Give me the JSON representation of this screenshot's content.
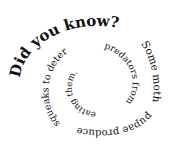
{
  "image": {
    "width": 174,
    "height": 150,
    "background": "#ffffff",
    "text_color": "#111111",
    "layout": "spiral text, clockwise, shrinking toward center"
  },
  "spiral": {
    "full_text": "Did you know? Some moth pupae produce squeaks to deter predators from eating them.",
    "segments": [
      {
        "text": "Did you know?",
        "size": 15
      },
      {
        "text": "Some moth",
        "size": 11
      },
      {
        "text": "pupae produce",
        "size": 10
      },
      {
        "text": "squeaks to deter",
        "size": 9.5
      },
      {
        "text": "predators from",
        "size": 9
      },
      {
        "text": "eating them.",
        "size": 8.5
      }
    ]
  }
}
